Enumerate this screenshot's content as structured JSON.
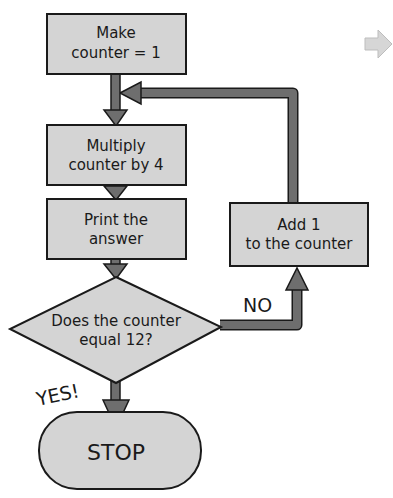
{
  "colors": {
    "box_fill": "#d4d4d4",
    "box_stroke": "#1a1a1a",
    "arrow_fill": "#6e6e6e",
    "nav_arrow": "#d6d6d6",
    "background": "#ffffff"
  },
  "nodes": {
    "start": {
      "line1": "Make",
      "line2": "counter = 1"
    },
    "multiply": {
      "line1": "Multiply",
      "line2": "counter by 4"
    },
    "print": {
      "line1": "Print the",
      "line2": "answer"
    },
    "decision": {
      "line1": "Does the counter",
      "line2": "equal 12?"
    },
    "add": {
      "line1": "Add 1",
      "line2": "to the counter"
    },
    "stop": {
      "label": "STOP"
    }
  },
  "edges": {
    "no_label": "NO",
    "yes_label": "YES!"
  },
  "nav": {
    "icon": "next-arrow-icon"
  }
}
